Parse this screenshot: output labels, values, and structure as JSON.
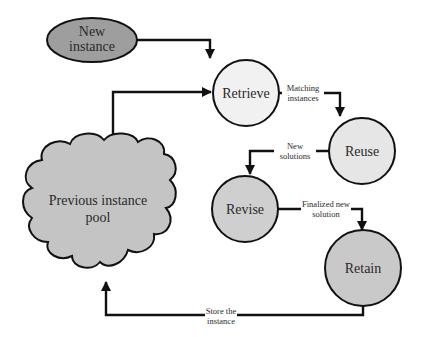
{
  "diagram": {
    "colors": {
      "stroke": "#111111",
      "background": "#ffffff",
      "new_instance_fill": "#9e9e9e",
      "retrieve_fill": "#f1f1f1",
      "reuse_fill": "#e6e6e6",
      "revise_fill": "#cfcfcf",
      "retain_fill": "#c9c9c9",
      "pool_fill": "#c4c4c4"
    },
    "nodes": {
      "new_instance": {
        "line1": "New",
        "line2": "instance",
        "shape": "ellipse"
      },
      "retrieve": {
        "label": "Retrieve",
        "shape": "circle"
      },
      "reuse": {
        "label": "Reuse",
        "shape": "circle"
      },
      "revise": {
        "label": "Revise",
        "shape": "circle"
      },
      "retain": {
        "label": "Retain",
        "shape": "circle"
      },
      "pool": {
        "line1": "Previous instance",
        "line2": "pool",
        "shape": "cloud"
      }
    },
    "edges": [
      {
        "from": "new_instance",
        "to": "retrieve",
        "line1": "",
        "line2": ""
      },
      {
        "from": "pool",
        "to": "retrieve",
        "line1": "",
        "line2": ""
      },
      {
        "from": "retrieve",
        "to": "reuse",
        "line1": "Matching",
        "line2": "instances"
      },
      {
        "from": "reuse",
        "to": "revise",
        "line1": "New",
        "line2": "solutions"
      },
      {
        "from": "revise",
        "to": "retain",
        "line1": "Finalized new",
        "line2": "solution"
      },
      {
        "from": "retain",
        "to": "pool",
        "line1": "Store the",
        "line2": "instance"
      }
    ]
  }
}
